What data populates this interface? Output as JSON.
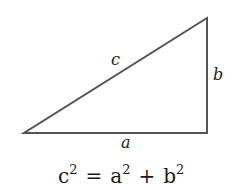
{
  "diagram": {
    "stroke_color": "#555555",
    "vertices": {
      "bottom_left": [
        24,
        133
      ],
      "bottom_right": [
        207,
        133
      ],
      "top_right": [
        207,
        18
      ]
    },
    "labels": {
      "hypotenuse": "c",
      "vertical_leg": "b",
      "horizontal_leg": "a"
    },
    "equation": {
      "lhs_base": "c",
      "lhs_exp": "2",
      "equals": "=",
      "a_base": "a",
      "a_exp": "2",
      "plus": "+",
      "b_base": "b",
      "b_exp": "2"
    }
  }
}
